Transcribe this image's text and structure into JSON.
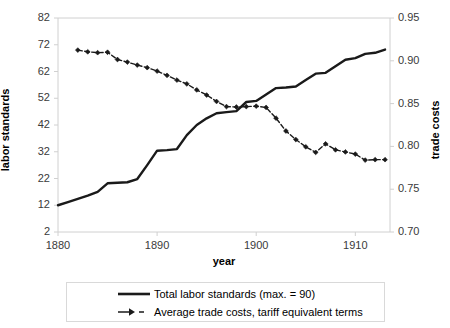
{
  "chart_data": {
    "type": "line",
    "title": "",
    "xlabel": "year",
    "ylabel": "labor standards",
    "y2label": "trade costs",
    "xlim": [
      1880,
      1913.5
    ],
    "ylim": [
      2,
      82
    ],
    "y2lim": [
      0.7,
      0.95
    ],
    "grid": false,
    "legend_position": "bottom",
    "xticks": [
      "1880",
      "1890",
      "1900",
      "1910"
    ],
    "xtick_values": [
      1880,
      1890,
      1900,
      1910
    ],
    "yticks": [
      "2",
      "12",
      "22",
      "32",
      "42",
      "52",
      "62",
      "72",
      "82"
    ],
    "ytick_values": [
      2,
      12,
      22,
      32,
      42,
      52,
      62,
      72,
      82
    ],
    "y2ticks": [
      "0.70",
      "0.75",
      "0.80",
      "0.85",
      "0.90",
      "0.95"
    ],
    "y2tick_values": [
      0.7,
      0.75,
      0.8,
      0.85,
      0.9,
      0.95
    ],
    "series": [
      {
        "name": "Total labor standards (max. = 90)",
        "axis": "left",
        "style": "solid",
        "marker": "none",
        "color": "#1a1a1a",
        "x": [
          1880,
          1881,
          1882,
          1883,
          1884,
          1885,
          1886,
          1887,
          1888,
          1889,
          1890,
          1891,
          1892,
          1893,
          1894,
          1895,
          1896,
          1897,
          1898,
          1899,
          1900,
          1901,
          1902,
          1903,
          1904,
          1905,
          1906,
          1907,
          1908,
          1909,
          1910,
          1911,
          1912,
          1913
        ],
        "values": [
          12.0,
          13.2,
          14.4,
          15.6,
          17.0,
          20.2,
          20.4,
          20.6,
          21.8,
          27.0,
          32.4,
          32.6,
          33.0,
          38.2,
          42.0,
          44.5,
          46.4,
          46.8,
          47.2,
          50.6,
          51.0,
          53.4,
          55.8,
          56.0,
          56.4,
          58.8,
          61.2,
          61.5,
          64.0,
          66.4,
          67.0,
          68.6,
          69.0,
          70.2
        ]
      },
      {
        "name": "Average trade costs, tariff equivalent terms",
        "axis": "right",
        "style": "dashed",
        "marker": "diamond",
        "color": "#1a1a1a",
        "x": [
          1882,
          1883,
          1884,
          1885,
          1886,
          1887,
          1888,
          1889,
          1890,
          1891,
          1892,
          1893,
          1894,
          1895,
          1896,
          1897,
          1898,
          1899,
          1900,
          1901,
          1902,
          1903,
          1904,
          1905,
          1906,
          1907,
          1908,
          1909,
          1910,
          1911,
          1912,
          1913
        ],
        "values": [
          0.9125,
          0.9105,
          0.9095,
          0.91,
          0.9015,
          0.8985,
          0.895,
          0.892,
          0.888,
          0.883,
          0.8775,
          0.873,
          0.866,
          0.86,
          0.8525,
          0.8465,
          0.846,
          0.8465,
          0.847,
          0.8455,
          0.833,
          0.818,
          0.808,
          0.7995,
          0.793,
          0.803,
          0.796,
          0.7935,
          0.791,
          0.784,
          0.7845,
          0.7845
        ]
      }
    ]
  },
  "legend": {
    "items": [
      {
        "label": "Total labor standards (max. = 90)",
        "key": "solid-line-key"
      },
      {
        "label": "Average trade costs, tariff equivalent terms",
        "key": "dashed-marker-line-key"
      }
    ]
  },
  "axes": {
    "x_title": "year",
    "y_left_title": "labor standards",
    "y_right_title": "trade costs"
  },
  "colors": {
    "series_line": "#1a1a1a",
    "frame": "#d0d0d0",
    "tick_text": "#3a3a3a",
    "background": "#ffffff"
  }
}
